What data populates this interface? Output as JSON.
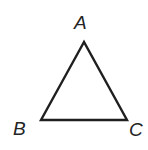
{
  "figure": {
    "name": "triangle-abc",
    "background_color": "#ffffff",
    "stroke_color": "#1f1f1f",
    "stroke_width": 2.4,
    "label_color": "#242424"
  },
  "labels": {
    "apex": "A",
    "bottom_left": "B",
    "bottom_right": "C"
  },
  "chart_data": {
    "type": "scatter",
    "title": "",
    "xlabel": "",
    "ylabel": "",
    "vertices": [
      {
        "label": "A",
        "x": 84,
        "y": 42
      },
      {
        "label": "B",
        "x": 41,
        "y": 120
      },
      {
        "label": "C",
        "x": 127,
        "y": 120
      }
    ],
    "edges": [
      {
        "from": "A",
        "to": "B"
      },
      {
        "from": "B",
        "to": "C"
      },
      {
        "from": "C",
        "to": "A"
      }
    ]
  }
}
